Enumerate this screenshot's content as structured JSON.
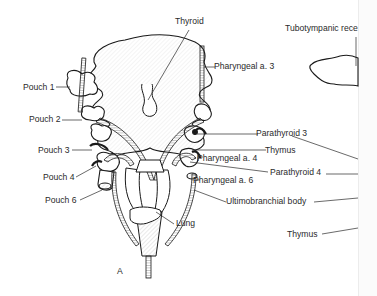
{
  "figure": {
    "panel_letter": "A",
    "colors": {
      "ink": "#1a1a1a",
      "label": "#2a2a2a",
      "hatch": "#9a9a9a",
      "background": "#ffffff"
    }
  },
  "labels": {
    "thyroid": "Thyroid",
    "tubotympanic_recess": "Tubotympanic rece",
    "pharyngeal_a3": "Pharyngeal a. 3",
    "pouch_1": "Pouch 1",
    "pouch_2": "Pouch 2",
    "pouch_3": "Pouch 3",
    "pouch_4": "Pouch 4",
    "pouch_6": "Pouch 6",
    "parathyroid_3": "Parathyroid 3",
    "thymus_upper": "Thymus",
    "pharyngeal_a4": "Pharyngeal a. 4",
    "parathyroid_4": "Parathyroid 4",
    "pharyngeal_a6": "Pharyngeal a. 6",
    "ultimobranchial_body": "Ultimobranchial body",
    "lung": "Lung",
    "thymus_lower": "Thymus"
  }
}
